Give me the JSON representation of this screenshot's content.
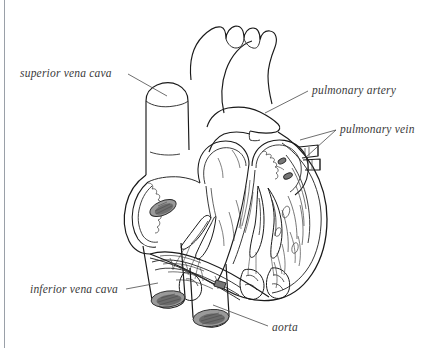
{
  "figure": {
    "width": 439,
    "height": 348,
    "background_color": "#ffffff",
    "ink_color": "#1a1a1a",
    "label_color": "#3a3a3a",
    "border_color": "#9aa0a8",
    "style": "black-and-white pen-and-ink line drawing, cutaway view"
  },
  "labels": [
    {
      "id": "superior-vena-cava",
      "text": "superior vena cava",
      "x": 20,
      "y": 68,
      "align": "left",
      "leader_from": [
        128,
        74
      ],
      "leader_to": [
        167,
        96
      ]
    },
    {
      "id": "pulmonary-artery",
      "text": "pulmonary artery",
      "x": 312,
      "y": 85,
      "align": "left",
      "leader_from": [
        308,
        91
      ],
      "leader_to": [
        265,
        113
      ]
    },
    {
      "id": "pulmonary-vein",
      "text": "pulmonary vein",
      "x": 340,
      "y": 124,
      "align": "left",
      "leader_from": [
        336,
        130
      ],
      "leader_to": [
        300,
        140
      ],
      "leader_to_2": [
        305,
        158
      ]
    },
    {
      "id": "inferior-vena-cava",
      "text": "inferior vena cava",
      "x": 30,
      "y": 284,
      "align": "left",
      "leader_from": [
        126,
        289
      ],
      "leader_to": [
        158,
        283
      ]
    },
    {
      "id": "aorta",
      "text": "aorta",
      "x": 272,
      "y": 322,
      "align": "left",
      "leader_from": [
        268,
        326
      ],
      "leader_to": [
        213,
        305
      ]
    }
  ],
  "structures": [
    {
      "id": "aortic-arch",
      "name": "aortic arch with three branch vessels"
    },
    {
      "id": "superior-vena-cava-vessel",
      "name": "superior vena cava trunk"
    },
    {
      "id": "pulmonary-artery-vessel",
      "name": "pulmonary artery trunk"
    },
    {
      "id": "pulmonary-vein-stubs",
      "name": "pulmonary vein openings"
    },
    {
      "id": "right-atrium",
      "name": "right atrium chamber, opened"
    },
    {
      "id": "left-atrium",
      "name": "left atrium chamber, opened"
    },
    {
      "id": "right-ventricle",
      "name": "right ventricle with trabeculae"
    },
    {
      "id": "left-ventricle",
      "name": "left ventricle, thick muscular wall"
    },
    {
      "id": "interventricular-septum",
      "name": "interventricular septum"
    },
    {
      "id": "valve-leaflets",
      "name": "atrioventricular valve leaflets"
    },
    {
      "id": "chordae-tendineae",
      "name": "chordae tendineae and papillary muscles"
    },
    {
      "id": "fossa-ovalis",
      "name": "shaded oval opening in right atrial wall"
    },
    {
      "id": "inferior-vena-cava-vessel",
      "name": "inferior vena cava trunk, cut end"
    },
    {
      "id": "aorta-vessel",
      "name": "ascending aorta trunk, cut end"
    }
  ]
}
